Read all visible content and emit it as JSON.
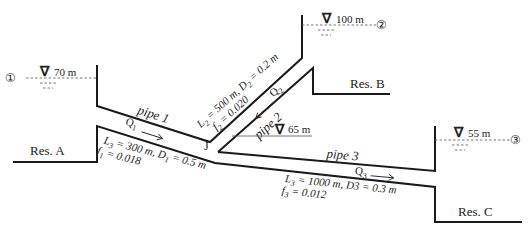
{
  "reservoirs": {
    "A": {
      "label": "Res. A",
      "level": "70 m",
      "node": "①"
    },
    "B": {
      "label": "Res. B",
      "level": "100 m",
      "node": "②"
    },
    "C": {
      "label": "Res. C",
      "level": "55 m",
      "node": "③"
    }
  },
  "junction": {
    "label": "J",
    "level": "65 m"
  },
  "pipes": {
    "p1": {
      "name": "pipe 1",
      "flow": "Q",
      "flow_sub": "1",
      "line1": "L",
      "line1_sub": "3",
      "line1_rest": " = 300 m, D",
      "line1_sub2": "1",
      "line1_end": " = 0.5 m",
      "line2": "f",
      "line2_sub": "1",
      "line2_rest": " = 0.018"
    },
    "p2": {
      "name": "pipe 2",
      "flow": "Q",
      "flow_sub": "2",
      "line1": "L",
      "line1_sub": "2",
      "line1_rest": " = 500 m, D",
      "line1_sub2": "2",
      "line1_end": " = 0.2 m",
      "line2": "f",
      "line2_sub": "2",
      "line2_rest": " = 0.020"
    },
    "p3": {
      "name": "pipe 3",
      "flow": "Q",
      "flow_sub": "3",
      "line1": "L",
      "line1_sub": "3",
      "line1_rest": " = 1000 m, D3 = 0.3 m",
      "line2": "f",
      "line2_sub": "3",
      "line2_rest": " = 0.012"
    }
  },
  "symbols": {
    "water_level": "∇"
  }
}
